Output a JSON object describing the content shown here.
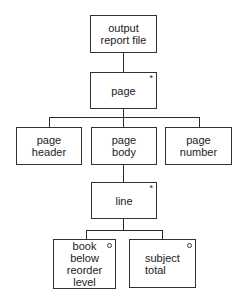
{
  "diagram": {
    "type": "jackson-structure-diagram",
    "nodes": {
      "root": {
        "label": "output\nreport file"
      },
      "page": {
        "label": "page",
        "marker": "*"
      },
      "page_header": {
        "label": "page\nheader"
      },
      "page_body": {
        "label": "page\nbody"
      },
      "page_number": {
        "label": "page\nnumber"
      },
      "line": {
        "label": "line",
        "marker": "*"
      },
      "book_below": {
        "label": "book\nbelow\nreorder\nlevel",
        "marker": "o"
      },
      "subject_total": {
        "label": "subject\ntotal",
        "marker": "o"
      }
    },
    "edges": [
      [
        "root",
        "page"
      ],
      [
        "page",
        "page_header"
      ],
      [
        "page",
        "page_body"
      ],
      [
        "page",
        "page_number"
      ],
      [
        "page_body",
        "line"
      ],
      [
        "line",
        "book_below"
      ],
      [
        "line",
        "subject_total"
      ]
    ]
  }
}
